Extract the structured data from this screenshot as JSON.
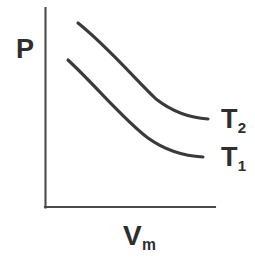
{
  "figure": {
    "kind": "pressure-volume-isotherm-diagram",
    "background_color": "#ffffff",
    "ink_color": "#3a3a3a",
    "axis_color": "#4a4a4a"
  },
  "axes": {
    "y_axis": {
      "label": "P",
      "label_name": "pressure",
      "x": 45,
      "y_top": 8,
      "y_bottom": 207
    },
    "x_axis": {
      "label": "V",
      "label_subscript": "m",
      "label_name": "molar-volume",
      "y": 207,
      "x_left": 45,
      "x_right": 215
    }
  },
  "curves": [
    {
      "id": "upper",
      "label": "T",
      "label_subscript": "2",
      "meaning": "higher-temperature-isotherm",
      "path": "M 78 23 C 108 47, 134 78, 156 99 C 174 113, 192 118, 208 119",
      "start": [
        78,
        23
      ],
      "end": [
        208,
        119
      ]
    },
    {
      "id": "lower",
      "label": "T",
      "label_subscript": "1",
      "meaning": "lower-temperature-isotherm",
      "path": "M 68 60 C 96 86, 124 120, 148 138, C 166 151, 185 156, 203 157",
      "start": [
        68,
        60
      ],
      "end": [
        203,
        157
      ]
    }
  ],
  "labels": {
    "pressure": "P",
    "volume_base": "V",
    "volume_subscript": "m",
    "t2_base": "T",
    "t2_subscript": "2",
    "t1_base": "T",
    "t1_subscript": "1"
  },
  "chart_data": {
    "type": "line",
    "title": "",
    "xlabel": "Vₘ",
    "ylabel": "P",
    "grid": false,
    "legend": "inline-right",
    "axis_ticks": false,
    "series": [
      {
        "name": "T₂",
        "description": "higher temperature isotherm, upper curve",
        "x": [
          78,
          100,
          120,
          140,
          160,
          180,
          208
        ],
        "y": [
          23,
          41,
          59,
          80,
          101,
          113,
          119
        ]
      },
      {
        "name": "T₁",
        "description": "lower temperature isotherm, lower curve",
        "x": [
          68,
          90,
          110,
          130,
          150,
          175,
          203
        ],
        "y": [
          60,
          81,
          100,
          121,
          139,
          151,
          157
        ]
      }
    ],
    "annotations": [
      "T₂ labels the upper isotherm",
      "T₁ labels the lower isotherm"
    ]
  }
}
